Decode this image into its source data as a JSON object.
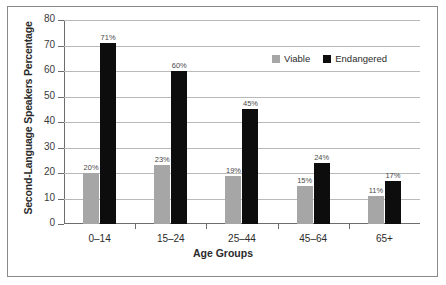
{
  "chart_data": {
    "type": "bar",
    "title": "",
    "xlabel": "Age Groups",
    "ylabel": "Second-Language Speakers Percentage",
    "categories": [
      "0–14",
      "15–24",
      "25–44",
      "45–64",
      "65+"
    ],
    "series": [
      {
        "name": "Viable",
        "color": "#a6a6a6",
        "values": [
          20,
          23,
          19,
          15,
          11
        ],
        "labels": [
          "20%",
          "23%",
          "19%",
          "15%",
          "11%"
        ]
      },
      {
        "name": "Endangered",
        "color": "#0d0d0d",
        "values": [
          71,
          60,
          45,
          24,
          17
        ],
        "labels": [
          "71%",
          "60%",
          "45%",
          "24%",
          "17%"
        ]
      }
    ],
    "ylim": [
      0,
      80
    ],
    "yticks": [
      0,
      10,
      20,
      30,
      40,
      50,
      60,
      70,
      80
    ],
    "ytick_labels": [
      "0",
      "10",
      "20",
      "30",
      "40",
      "50",
      "60",
      "70",
      "80"
    ],
    "grid": true,
    "legend_position": "upper-right-inside"
  }
}
